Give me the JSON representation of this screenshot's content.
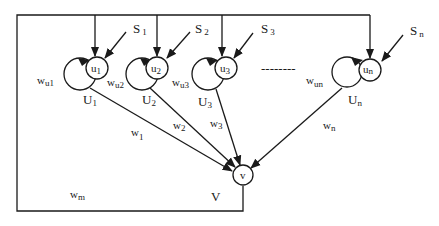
{
  "diagram": {
    "type": "neural-network-feedback-structure",
    "colors": {
      "stroke": "#1a1a1a",
      "background": "#ffffff"
    },
    "input_nodes": [
      {
        "node": "u",
        "node_sub": "1",
        "label": "U",
        "label_sub": "1",
        "input": "S",
        "input_sub": "1",
        "self_weight": "w",
        "self_weight_sub": "u1",
        "edge_weight": "w",
        "edge_weight_sub": "1"
      },
      {
        "node": "u",
        "node_sub": "2",
        "label": "U",
        "label_sub": "2",
        "input": "S",
        "input_sub": "2",
        "self_weight": "w",
        "self_weight_sub": "u2",
        "edge_weight": "w",
        "edge_weight_sub": "2"
      },
      {
        "node": "u",
        "node_sub": "3",
        "label": "U",
        "label_sub": "3",
        "input": "S",
        "input_sub": "3",
        "self_weight": "w",
        "self_weight_sub": "u3",
        "edge_weight": "w",
        "edge_weight_sub": "3"
      },
      {
        "node": "u",
        "node_sub": "n",
        "label": "U",
        "label_sub": "n",
        "input": "S",
        "input_sub": "n",
        "self_weight": "w",
        "self_weight_sub": "un",
        "edge_weight": "w",
        "edge_weight_sub": "n"
      }
    ],
    "ellipsis": "--------",
    "output_node": {
      "node": "v",
      "label": "V",
      "feedback_weight": "w",
      "feedback_weight_sub": "m"
    }
  }
}
